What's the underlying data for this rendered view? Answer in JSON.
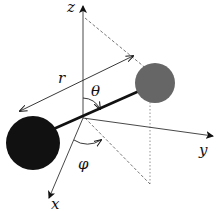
{
  "diagram": {
    "axes": {
      "x_label": "x",
      "y_label": "y",
      "z_label": "z"
    },
    "labels": {
      "radius": "r",
      "polar_angle": "θ",
      "azimuthal_angle": "φ"
    },
    "atoms": [
      {
        "name": "large-atom",
        "color": "#111111"
      },
      {
        "name": "small-atom",
        "color": "#666666"
      }
    ],
    "colors": {
      "axis": "#222222",
      "bond": "#111111",
      "guide_dashed": "#666666"
    }
  }
}
